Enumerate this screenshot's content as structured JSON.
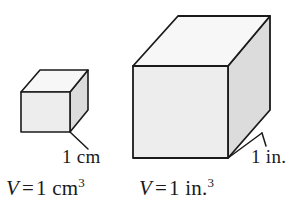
{
  "figure": {
    "background_color": "#ffffff",
    "stroke_color": "#1a1a1a",
    "face_colors": {
      "top": "#f7f7f7",
      "front": "#ededed",
      "side": "#dcdcdc"
    },
    "shapes": [
      {
        "name": "small-cube",
        "description": "cube representing one cubic centimeter",
        "edge_label": "1 cm",
        "volume_label": "V = 1 cm3"
      },
      {
        "name": "large-cube",
        "description": "cube representing one cubic inch",
        "edge_label": "1 in.",
        "volume_label": "V = 1 in.3"
      }
    ]
  },
  "labels": {
    "small_cube_dimension": "1 cm",
    "large_cube_dimension": "1 in.",
    "small_cube_volume": {
      "variable": "V",
      "equals": "=",
      "value": "1 cm",
      "exponent": "3"
    },
    "large_cube_volume": {
      "variable": "V",
      "equals": "=",
      "value": "1 in.",
      "exponent": "3"
    }
  }
}
